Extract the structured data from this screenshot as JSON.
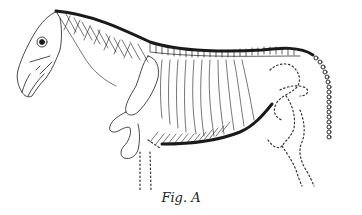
{
  "figure": {
    "caption": "Fig. A",
    "colors": {
      "ink": "#1a1a1a",
      "background": "#ffffff",
      "dotted_outline": "#333333"
    }
  }
}
